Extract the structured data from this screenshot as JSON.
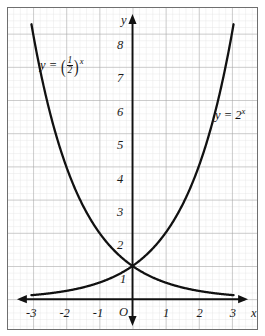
{
  "figure": {
    "kind": "cartesian-graph",
    "background": "#ffffff",
    "frame_color": "#6f6f6f",
    "curve_color": "#111111",
    "major_grid_color": "#9a9a9a",
    "minor_grid_color": "#e2e2e2",
    "axis_color": "#111111"
  },
  "axes": {
    "x_axis_name": "x",
    "y_axis_name": "y",
    "origin_label": "O",
    "x_ticks": [
      "-3",
      "-2",
      "-1",
      "1",
      "2",
      "3"
    ],
    "x_tick_values": [
      -3,
      -2,
      -1,
      1,
      2,
      3
    ],
    "y_ticks": [
      "1",
      "2",
      "3",
      "4",
      "5",
      "6",
      "7",
      "8"
    ],
    "y_tick_values": [
      1,
      2,
      3,
      4,
      5,
      6,
      7,
      8
    ],
    "xlim": [
      -3.76,
      3.76
    ],
    "ylim": [
      -0.9,
      8.77
    ],
    "minor_per_unit": 5,
    "x_arrow_left": true,
    "x_arrow_right": true,
    "y_arrow_up": true,
    "y_arrow_down": true
  },
  "labels": {
    "decay_curve_label": {
      "lhs": "y",
      "equals": "=",
      "numerator": "1",
      "denominator": "2",
      "exponent": "x"
    },
    "growth_curve_label": {
      "lhs": "y",
      "equals": "=",
      "base": "2",
      "exponent": "x"
    }
  },
  "chart_data": {
    "type": "line",
    "title": "",
    "xlabel": "x",
    "ylabel": "y",
    "xlim": [
      -3.76,
      3.76
    ],
    "ylim": [
      -0.9,
      8.77
    ],
    "grid": true,
    "legend": "inline-curve-labels",
    "x": [
      -3.05,
      -2.75,
      -2.5,
      -2.25,
      -2,
      -1.75,
      -1.5,
      -1.25,
      -1,
      -0.75,
      -0.5,
      -0.25,
      0,
      0.25,
      0.5,
      0.75,
      1,
      1.25,
      1.5,
      1.75,
      2,
      2.25,
      2.5,
      2.75,
      3.05
    ],
    "series": [
      {
        "name": "y = 2^x",
        "formula": "y = 2^x",
        "values": [
          0.121,
          0.149,
          0.177,
          0.21,
          0.25,
          0.297,
          0.354,
          0.42,
          0.5,
          0.595,
          0.707,
          0.841,
          1,
          1.189,
          1.414,
          1.682,
          2,
          2.378,
          2.828,
          3.364,
          4,
          4.757,
          5.657,
          6.727,
          8.28
        ]
      },
      {
        "name": "y = (1/2)^x",
        "formula": "y = (1/2)^x",
        "values": [
          8.28,
          6.727,
          5.657,
          4.757,
          4,
          3.364,
          2.828,
          2.378,
          2,
          1.682,
          1.414,
          1.189,
          1,
          0.841,
          0.707,
          0.595,
          0.5,
          0.42,
          0.354,
          0.297,
          0.25,
          0.21,
          0.177,
          0.149,
          0.121
        ]
      }
    ],
    "annotations": [
      {
        "text": "y = (1/2)^x",
        "x": -2.3,
        "y": 7.1
      },
      {
        "text": "y = 2^x",
        "x": 2.25,
        "y": 5.85
      }
    ],
    "intersection": {
      "x": 0,
      "y": 1
    }
  }
}
